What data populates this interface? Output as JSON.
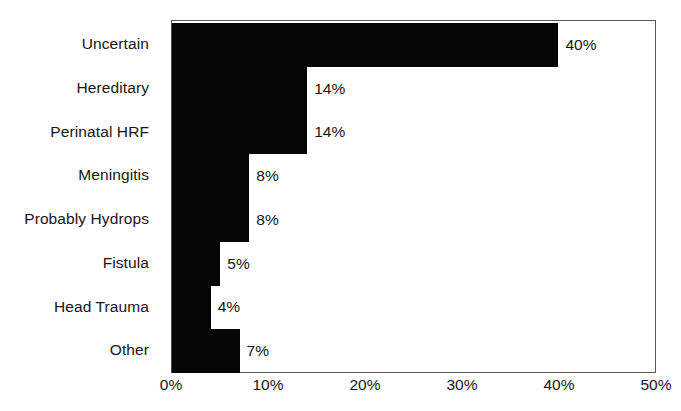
{
  "chart_data": {
    "type": "bar",
    "orientation": "horizontal",
    "title": "",
    "subtitle": "",
    "xlabel": "",
    "ylabel": "",
    "categories": [
      "Uncertain",
      "Hereditary",
      "Perinatal HRF",
      "Meningitis",
      "Probably Hydrops",
      "Fistula",
      "Head Trauma",
      "Other"
    ],
    "values": [
      40,
      14,
      14,
      8,
      8,
      5,
      4,
      7
    ],
    "value_labels": [
      "40%",
      "14%",
      "14%",
      "8%",
      "8%",
      "5%",
      "4%",
      "7%"
    ],
    "xlim": [
      0,
      50
    ],
    "xticks": [
      0,
      10,
      20,
      30,
      40,
      50
    ],
    "xtick_labels": [
      "0%",
      "10%",
      "20%",
      "30%",
      "40%",
      "50%"
    ],
    "grid": false,
    "legend": false,
    "bar_color": "#050505",
    "background_color": "#ffffff",
    "axis_color": "#5a5a5a",
    "text_color": "#161616",
    "units": "%"
  }
}
